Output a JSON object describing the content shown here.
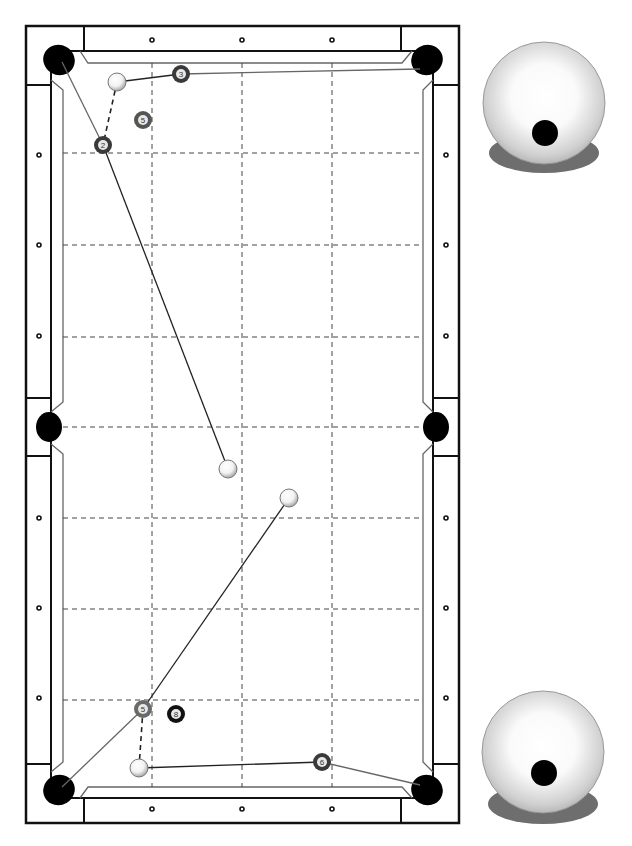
{
  "diagram": {
    "table": {
      "frame_color": "#111111",
      "cloth_color": "#ffffff",
      "pocket_color": "#000000",
      "grid_color": "#444444",
      "diamonds_top_x": [
        152,
        242,
        332
      ],
      "diamonds_side_y": [
        155,
        245,
        336,
        518,
        608,
        698
      ]
    },
    "shots": [
      {
        "id": "top",
        "cue_ball": {
          "x": 117,
          "y": 82
        },
        "object_balls": [
          {
            "number": "3",
            "x": 181,
            "y": 74,
            "style": "dark"
          },
          {
            "number": "5",
            "x": 143,
            "y": 120,
            "style": "dark"
          },
          {
            "number": "2",
            "x": 103,
            "y": 145,
            "style": "dark"
          }
        ],
        "cue_ball_end": {
          "x": 228,
          "y": 469
        },
        "spin_indicator": {
          "label": "draw / low cue ball",
          "cx": 544,
          "cy": 103,
          "dot_dx": 1,
          "dot_dy": 30
        }
      },
      {
        "id": "bottom",
        "cue_ball": {
          "x": 139,
          "y": 768
        },
        "object_balls": [
          {
            "number": "5",
            "x": 143,
            "y": 709,
            "style": "dark"
          },
          {
            "number": "8",
            "x": 176,
            "y": 714,
            "style": "black"
          },
          {
            "number": "6",
            "x": 322,
            "y": 762,
            "style": "dark"
          }
        ],
        "cue_ball_end": {
          "x": 289,
          "y": 498
        },
        "spin_indicator": {
          "label": "low cue ball",
          "cx": 543,
          "cy": 752,
          "dot_dx": 1,
          "dot_dy": 21
        }
      }
    ]
  }
}
